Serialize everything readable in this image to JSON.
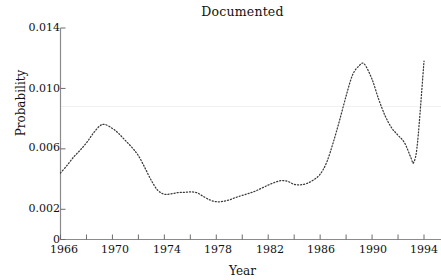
{
  "chart_data": {
    "type": "line",
    "title": "Documented",
    "xlabel": "Year",
    "ylabel": "Probability",
    "xlim": [
      1966,
      1994
    ],
    "ylim": [
      0,
      0.014
    ],
    "grid": false,
    "legend": null,
    "line_style": "dotted",
    "line_color": "#3a3a3a",
    "xticks": [
      1966,
      1970,
      1974,
      1978,
      1982,
      1986,
      1990,
      1994
    ],
    "xtick_labels": [
      "1966",
      "1970",
      "1974",
      "1978",
      "1982",
      "1986",
      "1990",
      "1994"
    ],
    "xminor_ticks": [
      1968,
      1972,
      1976,
      1980,
      1984,
      1988,
      1992
    ],
    "yticks": [
      0,
      0.002,
      0.006,
      0.01,
      0.014
    ],
    "ytick_labels": [
      "0",
      "0.002",
      "0.006",
      "0.010",
      "0.014"
    ],
    "reference_line_y": 0.0088,
    "x": [
      1966.0,
      1966.5,
      1967.0,
      1967.5,
      1968.0,
      1968.5,
      1969.0,
      1969.4,
      1970.0,
      1970.5,
      1971.0,
      1971.5,
      1972.0,
      1972.5,
      1973.0,
      1973.5,
      1974.0,
      1974.5,
      1975.0,
      1975.5,
      1976.0,
      1976.5,
      1977.0,
      1977.5,
      1978.0,
      1978.5,
      1979.0,
      1979.5,
      1980.0,
      1980.5,
      1981.0,
      1981.5,
      1982.0,
      1982.5,
      1983.0,
      1983.5,
      1984.0,
      1984.5,
      1985.0,
      1985.5,
      1986.0,
      1986.5,
      1987.0,
      1987.5,
      1988.0,
      1988.5,
      1989.0,
      1989.4,
      1990.0,
      1990.5,
      1991.0,
      1991.5,
      1992.0,
      1992.5,
      1993.0,
      1993.2,
      1993.5,
      1994.0
    ],
    "values": [
      0.0044,
      0.0049,
      0.00545,
      0.0059,
      0.0064,
      0.007,
      0.0075,
      0.00762,
      0.00735,
      0.007,
      0.00655,
      0.0061,
      0.00555,
      0.00475,
      0.0039,
      0.00325,
      0.003,
      0.00302,
      0.0031,
      0.00312,
      0.00315,
      0.0031,
      0.00285,
      0.00262,
      0.0025,
      0.00252,
      0.00262,
      0.00278,
      0.00292,
      0.00305,
      0.0032,
      0.0034,
      0.0036,
      0.00378,
      0.0039,
      0.00385,
      0.00365,
      0.00362,
      0.00372,
      0.00395,
      0.00432,
      0.0051,
      0.0064,
      0.0079,
      0.0095,
      0.0109,
      0.0115,
      0.01162,
      0.0106,
      0.0093,
      0.0082,
      0.0074,
      0.0069,
      0.0064,
      0.0054,
      0.0051,
      0.0064,
      0.0118
    ]
  },
  "axis": {
    "ytick_labels": [
      "0.014",
      "0.010",
      "0.006",
      "0.002",
      "0"
    ],
    "xtick_labels": [
      "1966",
      "1970",
      "1974",
      "1978",
      "1982",
      "1986",
      "1990",
      "1994"
    ]
  }
}
